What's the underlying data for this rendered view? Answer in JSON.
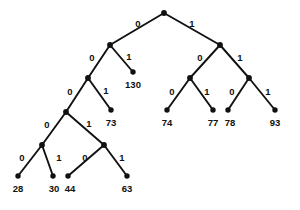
{
  "figure": {
    "name": "binary-code-tree",
    "type": "binary-tree-diagram",
    "width": 300,
    "height": 210,
    "background_color": "#ffffff",
    "ink_color": "#111111"
  },
  "nodes": [
    {
      "id": "root",
      "x": 164,
      "y": 13,
      "kind": "internal"
    },
    {
      "id": "n0",
      "x": 110,
      "y": 45,
      "kind": "internal"
    },
    {
      "id": "n1",
      "x": 220,
      "y": 45,
      "kind": "internal"
    },
    {
      "id": "n00",
      "x": 88,
      "y": 78,
      "kind": "internal"
    },
    {
      "id": "n01",
      "x": 133,
      "y": 72,
      "kind": "leaf"
    },
    {
      "id": "n10",
      "x": 190,
      "y": 78,
      "kind": "internal"
    },
    {
      "id": "n11",
      "x": 249,
      "y": 78,
      "kind": "internal"
    },
    {
      "id": "n000",
      "x": 66,
      "y": 112,
      "kind": "internal"
    },
    {
      "id": "n001",
      "x": 111,
      "y": 110,
      "kind": "leaf"
    },
    {
      "id": "n100",
      "x": 167,
      "y": 110,
      "kind": "leaf"
    },
    {
      "id": "n101",
      "x": 213,
      "y": 110,
      "kind": "leaf"
    },
    {
      "id": "n110",
      "x": 228,
      "y": 110,
      "kind": "leaf"
    },
    {
      "id": "n111",
      "x": 275,
      "y": 110,
      "kind": "leaf"
    },
    {
      "id": "n0000",
      "x": 42,
      "y": 145,
      "kind": "internal"
    },
    {
      "id": "n0001",
      "x": 104,
      "y": 145,
      "kind": "internal"
    },
    {
      "id": "n00000",
      "x": 18,
      "y": 176,
      "kind": "leaf"
    },
    {
      "id": "n00001",
      "x": 53,
      "y": 176,
      "kind": "leaf"
    },
    {
      "id": "n00010",
      "x": 68,
      "y": 176,
      "kind": "leaf"
    },
    {
      "id": "n00011",
      "x": 127,
      "y": 176,
      "kind": "leaf"
    }
  ],
  "edges": [
    {
      "from": "root",
      "to": "n0",
      "bit": "0",
      "label_x": 138,
      "label_y": 24
    },
    {
      "from": "root",
      "to": "n1",
      "bit": "1",
      "label_x": 192,
      "label_y": 24
    },
    {
      "from": "n0",
      "to": "n00",
      "bit": "0",
      "label_x": 92,
      "label_y": 58
    },
    {
      "from": "n0",
      "to": "n01",
      "bit": "1",
      "label_x": 129,
      "label_y": 57
    },
    {
      "from": "n1",
      "to": "n10",
      "bit": "0",
      "label_x": 200,
      "label_y": 58
    },
    {
      "from": "n1",
      "to": "n11",
      "bit": "1",
      "label_x": 240,
      "label_y": 58
    },
    {
      "from": "n00",
      "to": "n000",
      "bit": "0",
      "label_x": 70,
      "label_y": 92
    },
    {
      "from": "n00",
      "to": "n001",
      "bit": "1",
      "label_x": 106,
      "label_y": 91
    },
    {
      "from": "n10",
      "to": "n100",
      "bit": "0",
      "label_x": 172,
      "label_y": 92
    },
    {
      "from": "n10",
      "to": "n101",
      "bit": "1",
      "label_x": 207,
      "label_y": 92
    },
    {
      "from": "n11",
      "to": "n110",
      "bit": "0",
      "label_x": 232,
      "label_y": 92
    },
    {
      "from": "n11",
      "to": "n111",
      "bit": "1",
      "label_x": 268,
      "label_y": 92
    },
    {
      "from": "n000",
      "to": "n0000",
      "bit": "0",
      "label_x": 47,
      "label_y": 125
    },
    {
      "from": "n000",
      "to": "n0001",
      "bit": "1",
      "label_x": 89,
      "label_y": 124
    },
    {
      "from": "n0000",
      "to": "n00000",
      "bit": "0",
      "label_x": 22,
      "label_y": 158
    },
    {
      "from": "n0000",
      "to": "n00001",
      "bit": "1",
      "label_x": 59,
      "label_y": 158
    },
    {
      "from": "n0001",
      "to": "n00010",
      "bit": "0",
      "label_x": 85,
      "label_y": 158
    },
    {
      "from": "n0001",
      "to": "n00011",
      "bit": "1",
      "label_x": 122,
      "label_y": 158
    }
  ],
  "leaves": [
    {
      "node": "n01",
      "value": "130",
      "code": "01",
      "x": 133,
      "y": 85
    },
    {
      "node": "n001",
      "value": "73",
      "code": "001",
      "x": 111,
      "y": 123
    },
    {
      "node": "n100",
      "value": "74",
      "code": "100",
      "x": 167,
      "y": 123
    },
    {
      "node": "n101",
      "value": "77",
      "code": "101",
      "x": 213,
      "y": 123
    },
    {
      "node": "n110",
      "value": "78",
      "code": "110",
      "x": 230,
      "y": 123
    },
    {
      "node": "n111",
      "value": "93",
      "code": "111",
      "x": 275,
      "y": 123
    },
    {
      "node": "n00000",
      "value": "28",
      "code": "00000",
      "x": 18,
      "y": 189
    },
    {
      "node": "n00001",
      "value": "30",
      "code": "00001",
      "x": 54,
      "y": 189
    },
    {
      "node": "n00010",
      "value": "44",
      "code": "00010",
      "x": 70,
      "y": 189
    },
    {
      "node": "n00011",
      "value": "63",
      "code": "00011",
      "x": 127,
      "y": 189
    }
  ]
}
